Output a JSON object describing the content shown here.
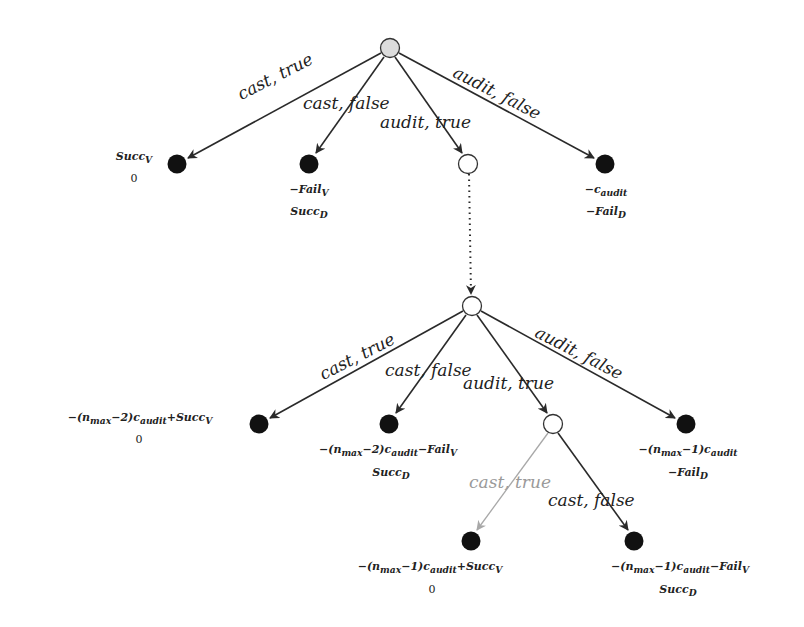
{
  "diagram": {
    "type": "game-tree",
    "nodes": {
      "root": {
        "x": 390,
        "y": 48,
        "fill": "#dcdcdc"
      },
      "l1_cast_true": {
        "x": 177,
        "y": 164,
        "fill": "#111111",
        "payoffs": [
          "Succ_V",
          "0"
        ]
      },
      "l1_cast_false": {
        "x": 309,
        "y": 164,
        "fill": "#111111",
        "payoffs": [
          "−Fail_V",
          "Succ_D"
        ]
      },
      "l1_audit_true": {
        "x": 468,
        "y": 164,
        "fill": "#ffffff"
      },
      "l1_audit_false": {
        "x": 605,
        "y": 164,
        "fill": "#111111",
        "payoffs": [
          "−c_audit",
          "−Fail_D"
        ]
      },
      "l2_root": {
        "x": 472,
        "y": 306,
        "fill": "#ffffff"
      },
      "l2_cast_true": {
        "x": 259,
        "y": 424,
        "fill": "#111111",
        "payoffs": [
          "−(n_max−2)c_audit+Succ_V",
          "0"
        ]
      },
      "l2_cast_false": {
        "x": 389,
        "y": 424,
        "fill": "#111111",
        "payoffs": [
          "−(n_max−2)c_audit−Fail_V",
          "Succ_D"
        ]
      },
      "l2_audit_true": {
        "x": 553,
        "y": 424,
        "fill": "#ffffff"
      },
      "l2_audit_false": {
        "x": 686,
        "y": 424,
        "fill": "#111111",
        "payoffs": [
          "−(n_max−1)c_audit",
          "−Fail_D"
        ]
      },
      "l3_cast_true": {
        "x": 471,
        "y": 541,
        "fill": "#111111",
        "payoffs": [
          "−(n_max−1)c_audit+Succ_V",
          "0"
        ]
      },
      "l3_cast_false": {
        "x": 634,
        "y": 541,
        "fill": "#111111",
        "payoffs": [
          "−(n_max−1)c_audit−Fail_V",
          "Succ_D"
        ]
      }
    },
    "edge_labels": {
      "cast_true": "cast, true",
      "cast_false": "cast, false",
      "audit_true": "audit, true",
      "audit_false": "audit, false"
    },
    "payoffs": {
      "l1_ct_1": "Succ",
      "l1_ct_1_sub": "V",
      "l1_ct_2": "0",
      "l1_cf_1": "−Fail",
      "l1_cf_1_sub": "V",
      "l1_cf_2": "Succ",
      "l1_cf_2_sub": "D",
      "l1_af_1": "−c",
      "l1_af_1_sub": "audit",
      "l1_af_2": "−Fail",
      "l1_af_2_sub": "D",
      "l2_ct_1": "−(n",
      "l2_ct_1_s1": "max",
      "l2_ct_1_m": "−2)c",
      "l2_ct_1_s2": "audit",
      "l2_ct_1_e": "+Succ",
      "l2_ct_1_s3": "V",
      "l2_ct_2": "0",
      "l2_cf_1": "−(n",
      "l2_cf_1_s1": "max",
      "l2_cf_1_m": "−2)c",
      "l2_cf_1_s2": "audit",
      "l2_cf_1_e": "−Fail",
      "l2_cf_1_s3": "V",
      "l2_cf_2": "Succ",
      "l2_cf_2_sub": "D",
      "l2_af_1": "−(n",
      "l2_af_1_s1": "max",
      "l2_af_1_m": "−1)c",
      "l2_af_1_s2": "audit",
      "l2_af_2": "−Fail",
      "l2_af_2_sub": "D",
      "l3_ct_1": "−(n",
      "l3_ct_1_s1": "max",
      "l3_ct_1_m": "−1)c",
      "l3_ct_1_s2": "audit",
      "l3_ct_1_e": "+Succ",
      "l3_ct_1_s3": "V",
      "l3_ct_2": "0",
      "l3_cf_1": "−(n",
      "l3_cf_1_s1": "max",
      "l3_cf_1_m": "−1)c",
      "l3_cf_1_s2": "audit",
      "l3_cf_1_e": "−Fail",
      "l3_cf_1_s3": "V",
      "l3_cf_2": "Succ",
      "l3_cf_2_sub": "D"
    },
    "colors": {
      "edge": "#2a2a2a",
      "edge_muted": "#a8a8a8",
      "leaf": "#111111",
      "root_fill": "#dcdcdc"
    }
  }
}
